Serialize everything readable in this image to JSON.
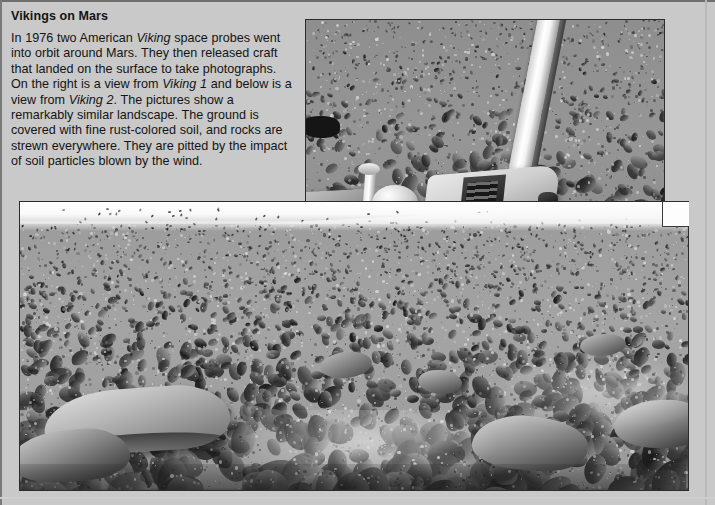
{
  "page": {
    "background_color": "#c9c9c9",
    "text_color": "#141414",
    "width": 715,
    "height": 505
  },
  "article": {
    "title": "Vikings on Mars",
    "paragraph_runs": [
      {
        "text": "In 1976 two American ",
        "style": "normal"
      },
      {
        "text": "Viking",
        "style": "italic"
      },
      {
        "text": " space probes went into orbit around Mars. They then released craft that landed on the surface to take photographs. On the right is a view from ",
        "style": "normal"
      },
      {
        "text": "Viking 1",
        "style": "italic"
      },
      {
        "text": " and below is a view from ",
        "style": "normal"
      },
      {
        "text": "Viking 2",
        "style": "italic"
      },
      {
        "text": ". The pictures show a remarkably similar landscape. The ground is covered with fine rust-colored soil, and rocks are strewn everywhere. They are pitted by the impact of soil particles blown by the wind.",
        "style": "normal"
      }
    ],
    "paragraph_plain": "In 1976 two American Viking space probes went into orbit around Mars. They then released craft that landed on the surface to take photographs. On the right is a view from Viking 1 and below is a view from Viking 2. The pictures show a remarkably similar landscape. The ground is covered with fine rust-colored soil, and rocks are strewn everywhere. They are pitted by the impact of soil particles blown by the wind."
  },
  "figures": [
    {
      "id": "viking-1-photo",
      "description": "Black and white photograph from Viking 1 lander: rock-strewn Martian plain with part of the lander spacecraft and a bright boom in the foreground",
      "position": "top-right",
      "x": 305,
      "y": 19,
      "width": 358,
      "height": 262,
      "palette": {
        "soil": "#8f8f8f",
        "rock_dark": "#3d3d3d",
        "highlight": "#f2f2f2",
        "lander": "#d9d9d9"
      }
    },
    {
      "id": "viking-2-photo",
      "description": "Black and white photograph from Viking 2 lander: wide view of a flat boulder-covered Martian plain with bright sky at the horizon",
      "position": "bottom-full-width",
      "x": 19,
      "y": 201,
      "width": 668,
      "height": 288,
      "palette": {
        "sky": "#fbfbfb",
        "soil": "#a2a2a2",
        "rock_dark": "#4a4a4a",
        "highlight": "#ededed"
      }
    }
  ]
}
